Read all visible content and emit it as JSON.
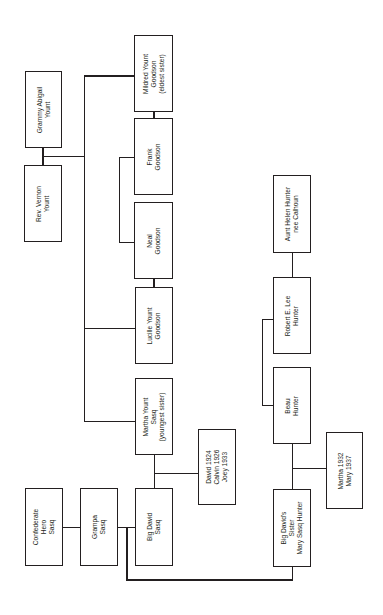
{
  "diagram": {
    "type": "family-tree",
    "orientation": "rotated-90-ccw",
    "colors": {
      "line": "#231f20",
      "box_border": "#231f20",
      "background": "#ffffff",
      "text": "#231f20"
    },
    "people": [
      {
        "id": "grammy",
        "label": "Grammy Abigail\nYount"
      },
      {
        "id": "vernon",
        "label": "Rev. Vernon\nYount"
      },
      {
        "id": "mildred",
        "label": "Mildred Yount\nGoodson\n(eldest sister)"
      },
      {
        "id": "frank",
        "label": "Frank\nGoodson"
      },
      {
        "id": "neal",
        "label": "Neal\nGoodson"
      },
      {
        "id": "lucille",
        "label": "Lucille Yount\nGoodson"
      },
      {
        "id": "martha",
        "label": "Martha Yount\nSasq\n(youngest sister)"
      },
      {
        "id": "sasq_kids",
        "label": "David 1924\nCalvin 1926\nJoey 1933"
      },
      {
        "id": "confederate",
        "label": "Confederate\nHero\nSasq"
      },
      {
        "id": "grampa",
        "label": "Grampa\nSasq"
      },
      {
        "id": "bigdavid",
        "label": "Big David\nSasq"
      },
      {
        "id": "helen",
        "label": "Aunt Helen Hunter\nnee Calhoun"
      },
      {
        "id": "robert",
        "label": "Robert E. Lee\nHunter"
      },
      {
        "id": "beau",
        "label": "Beau\nHunter"
      },
      {
        "id": "mary",
        "label": "Big David's\nSister\nMary Sasq Hunter"
      },
      {
        "id": "hunter_kids",
        "label": "Martha 1932\nMary 1937"
      }
    ]
  }
}
